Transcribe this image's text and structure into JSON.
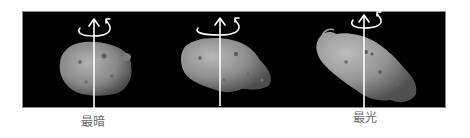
{
  "figure": {
    "panel_background": "#000000",
    "stroke_color": "#ffffff",
    "asteroid_color": "#8c8c8c",
    "views": [
      {
        "id": "view-1",
        "axis_x": 94,
        "caption": "最暗"
      },
      {
        "id": "view-2",
        "axis_x": 220,
        "caption": ""
      },
      {
        "id": "view-3",
        "axis_x": 364,
        "caption": "最光"
      }
    ],
    "captions": {
      "darkest": "最暗",
      "brightest": "最光"
    }
  }
}
